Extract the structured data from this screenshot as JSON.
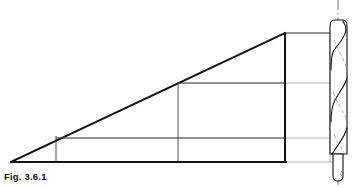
{
  "figure": {
    "caption": "Fig. 3.6.1",
    "kind": "engineering-line-drawing",
    "colors": {
      "ink": "#111111",
      "light_ink": "#8a8a8a",
      "hairline": "#b0b0b0",
      "background": "#ffffff"
    },
    "geometry": {
      "wedge": {
        "apex": [
          11,
          162
        ],
        "top_right": [
          285,
          33
        ],
        "bottom_right": [
          285,
          162
        ],
        "description": "large right triangle, hypotenuse rising left-to-right"
      },
      "inner_verticals_x": [
        56,
        178,
        285
      ],
      "inner_horizontals_y": [
        83,
        138,
        162
      ],
      "box_top_y": 33,
      "baseline_y": 162
    },
    "drill": {
      "center_x": 338,
      "body_left_x": 330,
      "body_right_x": 347,
      "tip_top_y": 20,
      "shank_bottom_y": 180,
      "flute_count": 2,
      "description": "side elevation of twist drill with helical flutes and centerline"
    }
  }
}
